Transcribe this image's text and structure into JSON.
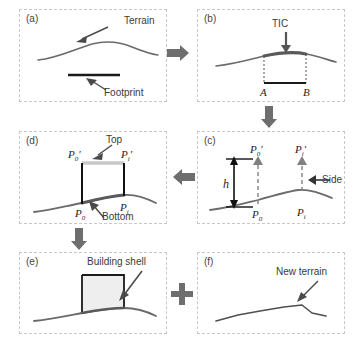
{
  "figure": {
    "type": "workflow-diagram",
    "panel_count": 6
  },
  "panels": {
    "a": {
      "tag": "(a)",
      "labels": {
        "terrain": "Terrain",
        "footprint": "Footprint"
      }
    },
    "b": {
      "tag": "(b)",
      "labels": {
        "tic": "TIC",
        "pointA": "A",
        "pointB": "B"
      }
    },
    "c": {
      "tag": "(c)",
      "labels": {
        "height": "h",
        "side": "Side",
        "p0": "P",
        "p0_sub": "0",
        "p0prime": "P",
        "p0prime_sub": "0",
        "pi": "P",
        "pi_sub": "i",
        "piprime": "P",
        "piprime_sub": "i",
        "prime": "′"
      }
    },
    "d": {
      "tag": "(d)",
      "labels": {
        "top": "Top",
        "bottom": "Bottom",
        "p0": "P",
        "p0_sub": "0",
        "p0prime": "P",
        "p0prime_sub": "0",
        "pi": "P",
        "pi_sub": "i",
        "piprime": "P",
        "piprime_sub": "i",
        "prime": "′"
      }
    },
    "e": {
      "tag": "(e)",
      "labels": {
        "building_shell": "Building shell"
      }
    },
    "f": {
      "tag": "(f)",
      "labels": {
        "new_terrain": "New terrain"
      }
    }
  },
  "connectors": {
    "a_to_b": "arrow-right",
    "b_to_c": "arrow-down",
    "c_to_d": "arrow-left",
    "d_to_e": "arrow-down",
    "e_plus_f": "plus-sign"
  },
  "colors": {
    "panel_border": "#c8c8c8",
    "terrain_line": "#6b6b6b",
    "footprint_line": "#1a1a1a",
    "connector_gray": "#6e6e6e",
    "shell_fill": "#eaeaea",
    "shell_stroke": "#1a1a1a",
    "top_line": "#c9c9c9",
    "text": "#3a3a3a"
  }
}
